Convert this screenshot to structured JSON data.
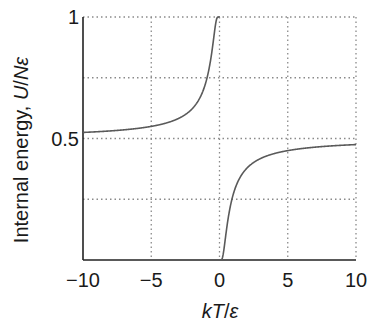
{
  "chart_data": {
    "type": "line",
    "title": "",
    "xlabel": "kT/ε",
    "xlabel_parts": {
      "k": "k",
      "T": "T",
      "slash": "/",
      "eps": "ε"
    },
    "ylabel": "Internal energy, U/Nε",
    "ylabel_parts": {
      "plain": "Internal energy, ",
      "U": "U",
      "slash": "/",
      "N": "N",
      "eps": "ε"
    },
    "xlim": [
      -10,
      10
    ],
    "ylim": [
      0,
      1
    ],
    "xticks": [
      -10,
      -5,
      0,
      5,
      10
    ],
    "xtick_labels": [
      "−10",
      "−5",
      "0",
      "5",
      "10"
    ],
    "yticks": [
      0.5,
      1
    ],
    "ytick_labels": [
      "0.5",
      "1"
    ],
    "grid": {
      "x": [
        -5,
        0,
        5,
        10
      ],
      "y": [
        0.25,
        0.5,
        0.75,
        1
      ],
      "style": "dotted"
    },
    "legend": null,
    "series": [
      {
        "name": "U/Nε = 1/(1+exp(ε/kT))",
        "x": [
          -10,
          -8,
          -6,
          -5,
          -4,
          -3,
          -2,
          -1.5,
          -1,
          -0.7,
          -0.5,
          -0.4,
          -0.3,
          -0.2,
          -0.1,
          -0.05,
          0.05,
          0.1,
          0.2,
          0.3,
          0.4,
          0.5,
          0.7,
          1,
          1.5,
          2,
          3,
          4,
          5,
          6,
          8,
          10
        ],
        "y": [
          0.525,
          0.531,
          0.542,
          0.55,
          0.562,
          0.583,
          0.622,
          0.661,
          0.731,
          0.807,
          0.881,
          0.924,
          0.966,
          0.993,
          1.0,
          1.0,
          0.0,
          0.0,
          0.007,
          0.034,
          0.076,
          0.119,
          0.193,
          0.269,
          0.339,
          0.378,
          0.417,
          0.438,
          0.45,
          0.458,
          0.469,
          0.475
        ]
      }
    ]
  },
  "colors": {
    "curve": "#5a5a5a",
    "axis": "#222222",
    "grid": "#8a8a8a",
    "text": "#1a1a1a"
  }
}
